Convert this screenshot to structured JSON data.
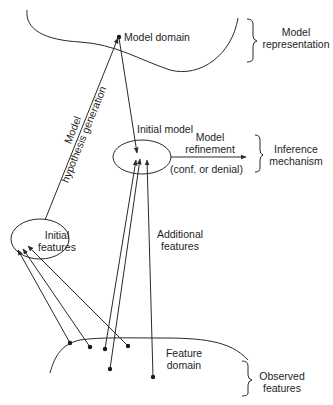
{
  "labels": {
    "model_domain": "Model domain",
    "model_representation_line1": "Model",
    "model_representation_line2": "representation",
    "hypothesis_line1": "Model",
    "hypothesis_line2": "hypothesis generation",
    "initial_model": "Initial model",
    "model_refinement_line1": "Model",
    "model_refinement_line2": "refinement",
    "conf_or_denial": "(conf. or denial)",
    "inference_line1": "Inference",
    "inference_line2": "mechanism",
    "initial_features_line1": "Initial",
    "initial_features_line2": "features",
    "additional_line1": "Additional",
    "additional_line2": "features",
    "feature_domain_line1": "Feature",
    "feature_domain_line2": "domain",
    "observed_line1": "Observed",
    "observed_line2": "features"
  },
  "colors": {
    "stroke": "#2a2a2a",
    "background": "#ffffff"
  }
}
